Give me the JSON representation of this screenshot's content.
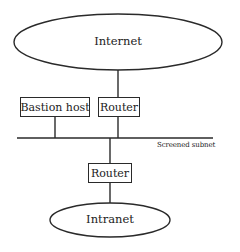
{
  "diagram": {
    "type": "network-topology",
    "title": "",
    "nodes": [
      {
        "id": "internet",
        "label": "Internet",
        "shape": "ellipse"
      },
      {
        "id": "bastion",
        "label": "Bastion host",
        "shape": "box"
      },
      {
        "id": "router_outer",
        "label": "Router",
        "shape": "box"
      },
      {
        "id": "router_inner",
        "label": "Router",
        "shape": "box"
      },
      {
        "id": "intranet",
        "label": "Intranet",
        "shape": "ellipse"
      }
    ],
    "segments": [
      {
        "id": "screened_subnet",
        "label": "Screened subnet",
        "shape": "bus-line"
      }
    ],
    "edges": [
      {
        "from": "internet",
        "to": "router_outer"
      },
      {
        "from": "router_outer",
        "to": "screened_subnet"
      },
      {
        "from": "bastion",
        "to": "screened_subnet"
      },
      {
        "from": "screened_subnet",
        "to": "router_inner"
      },
      {
        "from": "router_inner",
        "to": "intranet"
      }
    ]
  },
  "labels": {
    "internet": "Internet",
    "bastion": "Bastion host",
    "router_outer": "Router",
    "router_inner": "Router",
    "intranet": "Intranet",
    "subnet": "Screened subnet"
  },
  "colors": {
    "stroke": "#2a2a2a",
    "text": "#222222",
    "background": "#ffffff"
  }
}
